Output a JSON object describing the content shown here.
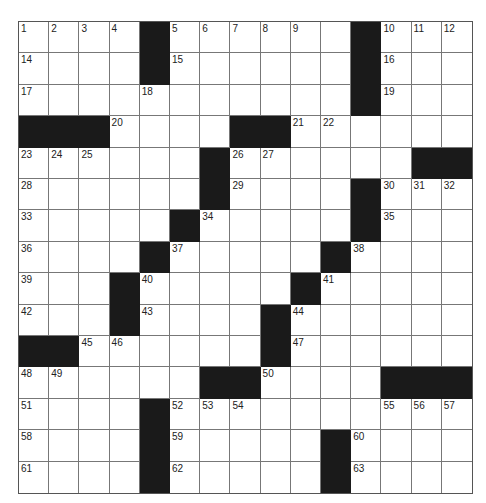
{
  "puzzle": {
    "rows": 15,
    "cols": 15,
    "colors": {
      "block": "#1a1a1a",
      "cell": "#ffffff",
      "line": "#777777"
    },
    "black_cells": [
      [
        0,
        4
      ],
      [
        0,
        11
      ],
      [
        1,
        4
      ],
      [
        1,
        11
      ],
      [
        2,
        11
      ],
      [
        3,
        0
      ],
      [
        3,
        1
      ],
      [
        3,
        2
      ],
      [
        3,
        7
      ],
      [
        3,
        8
      ],
      [
        4,
        6
      ],
      [
        4,
        13
      ],
      [
        4,
        14
      ],
      [
        5,
        6
      ],
      [
        5,
        11
      ],
      [
        6,
        5
      ],
      [
        6,
        11
      ],
      [
        7,
        4
      ],
      [
        7,
        10
      ],
      [
        8,
        3
      ],
      [
        8,
        9
      ],
      [
        9,
        3
      ],
      [
        9,
        8
      ],
      [
        10,
        0
      ],
      [
        10,
        1
      ],
      [
        10,
        8
      ],
      [
        11,
        6
      ],
      [
        11,
        7
      ],
      [
        11,
        12
      ],
      [
        11,
        13
      ],
      [
        11,
        14
      ],
      [
        12,
        4
      ],
      [
        13,
        4
      ],
      [
        13,
        10
      ],
      [
        14,
        4
      ],
      [
        14,
        10
      ]
    ],
    "numbers": [
      {
        "r": 0,
        "c": 0,
        "n": "1"
      },
      {
        "r": 0,
        "c": 1,
        "n": "2"
      },
      {
        "r": 0,
        "c": 2,
        "n": "3"
      },
      {
        "r": 0,
        "c": 3,
        "n": "4"
      },
      {
        "r": 0,
        "c": 5,
        "n": "5"
      },
      {
        "r": 0,
        "c": 6,
        "n": "6"
      },
      {
        "r": 0,
        "c": 7,
        "n": "7"
      },
      {
        "r": 0,
        "c": 8,
        "n": "8"
      },
      {
        "r": 0,
        "c": 9,
        "n": "9"
      },
      {
        "r": 0,
        "c": 12,
        "n": "10"
      },
      {
        "r": 0,
        "c": 13,
        "n": "11"
      },
      {
        "r": 0,
        "c": 14,
        "n": "12"
      },
      {
        "r": 1,
        "c": 0,
        "n": "14"
      },
      {
        "r": 1,
        "c": 5,
        "n": "15"
      },
      {
        "r": 1,
        "c": 12,
        "n": "16"
      },
      {
        "r": 2,
        "c": 0,
        "n": "17"
      },
      {
        "r": 2,
        "c": 4,
        "n": "18"
      },
      {
        "r": 2,
        "c": 12,
        "n": "19"
      },
      {
        "r": 3,
        "c": 3,
        "n": "20"
      },
      {
        "r": 3,
        "c": 9,
        "n": "21"
      },
      {
        "r": 3,
        "c": 10,
        "n": "22"
      },
      {
        "r": 4,
        "c": 0,
        "n": "23"
      },
      {
        "r": 4,
        "c": 1,
        "n": "24"
      },
      {
        "r": 4,
        "c": 2,
        "n": "25"
      },
      {
        "r": 4,
        "c": 7,
        "n": "26"
      },
      {
        "r": 4,
        "c": 8,
        "n": "27"
      },
      {
        "r": 5,
        "c": 0,
        "n": "28"
      },
      {
        "r": 5,
        "c": 7,
        "n": "29"
      },
      {
        "r": 5,
        "c": 12,
        "n": "30"
      },
      {
        "r": 5,
        "c": 13,
        "n": "31"
      },
      {
        "r": 5,
        "c": 14,
        "n": "32"
      },
      {
        "r": 6,
        "c": 0,
        "n": "33"
      },
      {
        "r": 6,
        "c": 6,
        "n": "34"
      },
      {
        "r": 6,
        "c": 12,
        "n": "35"
      },
      {
        "r": 7,
        "c": 0,
        "n": "36"
      },
      {
        "r": 7,
        "c": 5,
        "n": "37"
      },
      {
        "r": 7,
        "c": 11,
        "n": "38"
      },
      {
        "r": 8,
        "c": 0,
        "n": "39"
      },
      {
        "r": 8,
        "c": 4,
        "n": "40"
      },
      {
        "r": 8,
        "c": 10,
        "n": "41"
      },
      {
        "r": 9,
        "c": 0,
        "n": "42"
      },
      {
        "r": 9,
        "c": 4,
        "n": "43"
      },
      {
        "r": 9,
        "c": 9,
        "n": "44"
      },
      {
        "r": 10,
        "c": 2,
        "n": "45"
      },
      {
        "r": 10,
        "c": 3,
        "n": "46"
      },
      {
        "r": 10,
        "c": 9,
        "n": "47"
      },
      {
        "r": 11,
        "c": 0,
        "n": "48"
      },
      {
        "r": 11,
        "c": 1,
        "n": "49"
      },
      {
        "r": 11,
        "c": 8,
        "n": "50"
      },
      {
        "r": 12,
        "c": 0,
        "n": "51"
      },
      {
        "r": 12,
        "c": 5,
        "n": "52"
      },
      {
        "r": 12,
        "c": 6,
        "n": "53"
      },
      {
        "r": 12,
        "c": 7,
        "n": "54"
      },
      {
        "r": 12,
        "c": 12,
        "n": "55"
      },
      {
        "r": 12,
        "c": 13,
        "n": "56"
      },
      {
        "r": 12,
        "c": 14,
        "n": "57"
      },
      {
        "r": 13,
        "c": 0,
        "n": "58"
      },
      {
        "r": 13,
        "c": 5,
        "n": "59"
      },
      {
        "r": 13,
        "c": 11,
        "n": "60"
      },
      {
        "r": 14,
        "c": 0,
        "n": "61"
      },
      {
        "r": 14,
        "c": 5,
        "n": "62"
      },
      {
        "r": 14,
        "c": 11,
        "n": "63"
      }
    ]
  }
}
